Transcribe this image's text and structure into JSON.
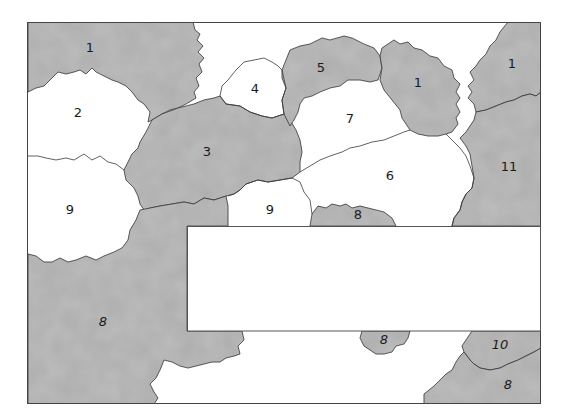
{
  "diagram": {
    "type": "numbered region map (paint-by-number style)",
    "frame": {
      "x": 27,
      "y": 22,
      "width": 514,
      "height": 382
    },
    "colors": {
      "shaded": "#b9b9b9",
      "shaded_dark": "#a8a8a8",
      "unshaded": "#ffffff",
      "outline": "#3a3a3a"
    },
    "regions": [
      {
        "label": "1",
        "x": 90,
        "y": 47,
        "shaded": true
      },
      {
        "label": "2",
        "x": 78,
        "y": 112,
        "shaded": false
      },
      {
        "label": "3",
        "x": 207,
        "y": 151,
        "shaded": true
      },
      {
        "label": "4",
        "x": 255,
        "y": 88,
        "shaded": false
      },
      {
        "label": "5",
        "x": 321,
        "y": 67,
        "shaded": true
      },
      {
        "label": "1",
        "x": 418,
        "y": 82,
        "shaded": true
      },
      {
        "label": "1",
        "x": 512,
        "y": 63,
        "shaded": true
      },
      {
        "label": "7",
        "x": 350,
        "y": 118,
        "shaded": false
      },
      {
        "label": "6",
        "x": 390,
        "y": 175,
        "shaded": false
      },
      {
        "label": "11",
        "x": 509,
        "y": 166,
        "shaded": true
      },
      {
        "label": "9",
        "x": 70,
        "y": 209,
        "shaded": false
      },
      {
        "label": "9",
        "x": 270,
        "y": 209,
        "shaded": false
      },
      {
        "label": "8",
        "x": 358,
        "y": 214,
        "shaded": true
      },
      {
        "label": "8",
        "x": 103,
        "y": 321,
        "shaded": true
      },
      {
        "label": "8",
        "x": 384,
        "y": 339,
        "shaded": true
      },
      {
        "label": "10",
        "x": 500,
        "y": 344,
        "shaded": true
      },
      {
        "label": "8",
        "x": 508,
        "y": 384,
        "shaded": true
      }
    ],
    "overlay_box": {
      "x": 187,
      "y": 226,
      "width": 353,
      "height": 105,
      "text": ""
    }
  }
}
